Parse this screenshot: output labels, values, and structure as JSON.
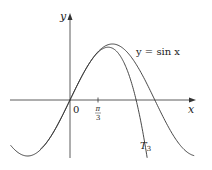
{
  "chart_data": {
    "type": "line",
    "title": "",
    "xlabel": "x",
    "ylabel": "y",
    "x_ticks": [
      {
        "value": 1.0472,
        "label": "π/3"
      }
    ],
    "origin_label": "0",
    "xlim": [
      -2.3,
      4.7
    ],
    "ylim": [
      -1.2,
      1.7
    ],
    "grid": false,
    "series": [
      {
        "name": "y = sin x",
        "function": "sin(x)",
        "label": "y = sin x"
      },
      {
        "name": "T3",
        "function": "x - x^3/6",
        "label": "T3"
      }
    ],
    "annotations": [
      "y = sin x",
      "T3"
    ]
  },
  "labels": {
    "y_axis": "y",
    "x_axis": "x",
    "origin": "0",
    "tick_num": "π",
    "tick_den": "3",
    "sin_label": "y = sin x",
    "t3_main": "T",
    "t3_sub": "3"
  },
  "colors": {
    "axis": "#333333",
    "curve": "#333333",
    "background": "#ffffff"
  }
}
